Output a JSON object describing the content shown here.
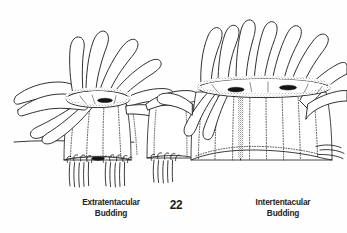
{
  "figure": {
    "number": "22",
    "type": "scientific-line-drawing",
    "background_color": "#fefefe",
    "ink_color": "#1a1a1a",
    "caption_color": "#232323"
  },
  "captions": {
    "left": {
      "line1": "Extratentacular",
      "line2": "Budding"
    },
    "right": {
      "line1": "Intertentacular",
      "line2": "Budding"
    }
  }
}
